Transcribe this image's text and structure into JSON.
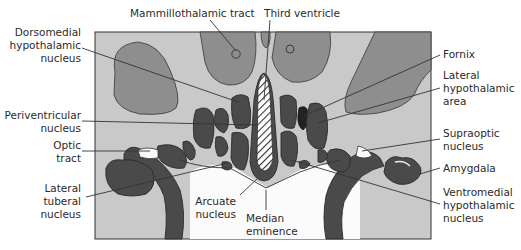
{
  "figure": {
    "type": "anatomical-diagram",
    "colors": {
      "background_tissue": "#c9c9c9",
      "large_regions": "#8e8e8e",
      "nuclei": "#4a4a4a",
      "fornix": "#222222",
      "ventricle_hatch": "#ffffff",
      "label_text": "#2a2a2a"
    }
  },
  "labels": {
    "mammillothalamic_tract": "Mammillothalamic tract",
    "third_ventricle": "Third ventricle",
    "dorsomedial": [
      "Dorsomedial",
      "hypothalamic",
      "nucleus"
    ],
    "fornix": "Fornix",
    "lateral_hypothalamic_area": [
      "Lateral",
      "hypothalamic",
      "area"
    ],
    "periventricular": [
      "Periventricular",
      "nucleus"
    ],
    "optic_tract": [
      "Optic",
      "tract"
    ],
    "supraoptic": [
      "Supraoptic",
      "nucleus"
    ],
    "amygdala": "Amygdala",
    "lateral_tuberal": [
      "Lateral",
      "tuberal",
      "nucleus"
    ],
    "arcuate": [
      "Arcuate",
      "nucleus"
    ],
    "median_eminence": [
      "Median",
      "eminence"
    ],
    "ventromedial": [
      "Ventromedial",
      "hypothalamic",
      "nucleus"
    ]
  }
}
